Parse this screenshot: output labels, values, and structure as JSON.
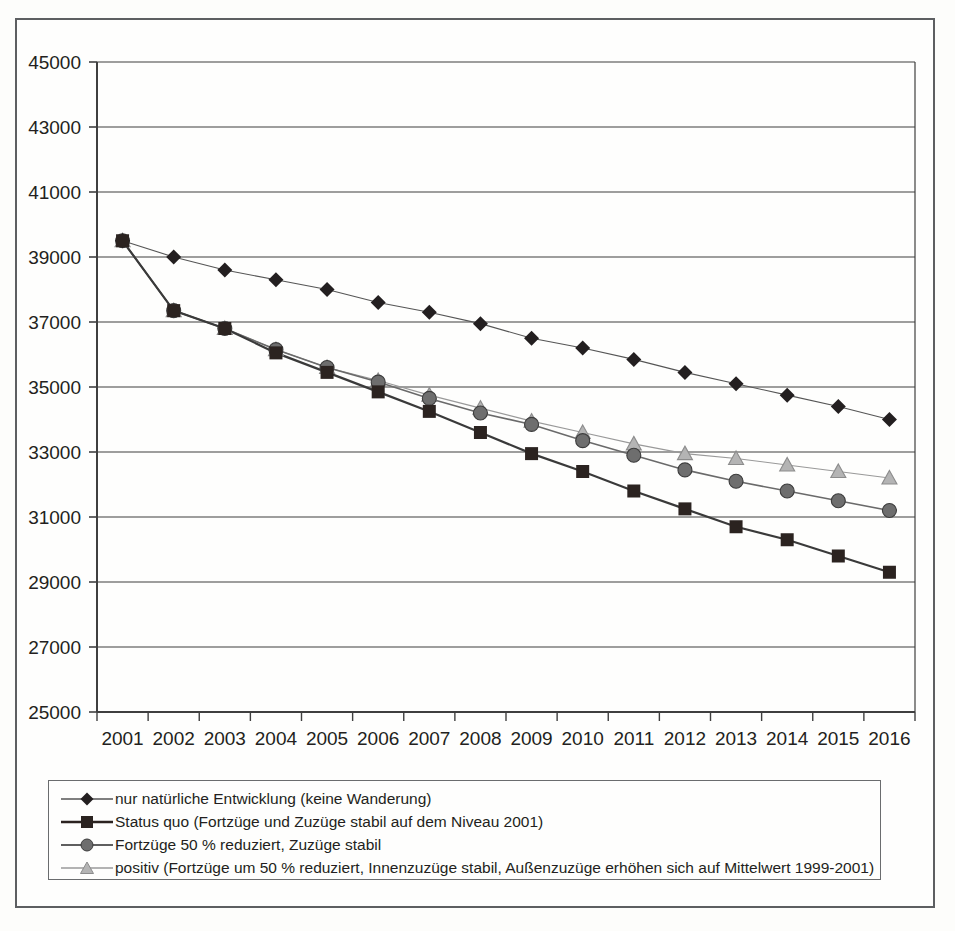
{
  "chart_data": {
    "type": "line",
    "title": "",
    "xlabel": "",
    "ylabel": "",
    "ylim": [
      25000,
      45000
    ],
    "ytick_step": 2000,
    "yticks": [
      25000,
      27000,
      29000,
      31000,
      33000,
      35000,
      37000,
      39000,
      41000,
      43000,
      45000
    ],
    "grid": true,
    "legend_position": "bottom",
    "categories": [
      2001,
      2002,
      2003,
      2004,
      2005,
      2006,
      2007,
      2008,
      2009,
      2010,
      2011,
      2012,
      2013,
      2014,
      2015,
      2016
    ],
    "series": [
      {
        "name": "nur natürliche Entwicklung (keine Wanderung)",
        "marker": "diamond",
        "color": "#231f20",
        "line_color": "#555555",
        "line_width": 1.1,
        "values": [
          39500,
          39000,
          38600,
          38300,
          38000,
          37600,
          37300,
          36950,
          36500,
          36200,
          35850,
          35450,
          35100,
          34750,
          34400,
          34000
        ]
      },
      {
        "name": "Status quo (Fortzüge und Zuzüge stabil auf dem Niveau 2001)",
        "marker": "square",
        "color": "#2b2320",
        "line_color": "#3a3a3a",
        "line_width": 2.2,
        "values": [
          39500,
          37350,
          36800,
          36050,
          35450,
          34850,
          34250,
          33600,
          32950,
          32400,
          31800,
          31250,
          30700,
          30300,
          29800,
          29300
        ]
      },
      {
        "name": "Fortzüge 50 % reduziert, Zuzüge stabil",
        "marker": "circle",
        "color": "#6e6e6e",
        "line_color": "#6a6a6a",
        "line_width": 1.6,
        "values": [
          39500,
          37350,
          36800,
          36150,
          35600,
          35150,
          34650,
          34200,
          33850,
          33350,
          32900,
          32450,
          32100,
          31800,
          31500,
          31200
        ]
      },
      {
        "name": "positiv (Fortzüge um 50 % reduziert, Innenzuzüge stabil, Außenzuzüge erhöhen sich auf Mittelwert 1999-2001)",
        "marker": "triangle",
        "color": "#a8a8a8",
        "line_color": "#999999",
        "line_width": 1.1,
        "values": [
          39500,
          37350,
          36800,
          36150,
          35600,
          35200,
          34750,
          34350,
          33950,
          33600,
          33250,
          32950,
          32800,
          32600,
          32400,
          32200
        ]
      }
    ]
  },
  "legend": {
    "entries": [
      {
        "label": "nur natürliche Entwicklung (keine Wanderung)",
        "marker": "diamond-marker-icon"
      },
      {
        "label": "Status quo (Fortzüge und Zuzüge stabil auf dem Niveau 2001)",
        "marker": "square-marker-icon"
      },
      {
        "label": "Fortzüge 50 % reduziert, Zuzüge stabil",
        "marker": "circle-marker-icon"
      },
      {
        "label": "positiv (Fortzüge um 50 % reduziert, Innenzuzüge stabil, Außenzuzüge erhöhen sich auf Mittelwert 1999-2001)",
        "marker": "triangle-marker-icon"
      }
    ]
  }
}
